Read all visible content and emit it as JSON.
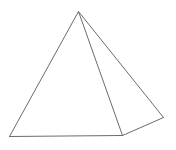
{
  "diagram": {
    "title": "",
    "shape": "square pyramid (wireframe)",
    "stroke_color": "#6b6b6b",
    "background": "#ffffff",
    "vertices": {
      "apex": [
        78,
        11
      ],
      "base_front_left": [
        9,
        136
      ],
      "base_front_right": [
        122,
        135
      ],
      "base_back_right": [
        163,
        117
      ]
    },
    "edges": [
      {
        "name": "edge-apex-front-left",
        "from": "apex",
        "to": "base_front_left"
      },
      {
        "name": "edge-apex-front-right",
        "from": "apex",
        "to": "base_front_right"
      },
      {
        "name": "edge-apex-back-right",
        "from": "apex",
        "to": "base_back_right"
      },
      {
        "name": "edge-base-front",
        "from": "base_front_left",
        "to": "base_front_right"
      },
      {
        "name": "edge-base-right",
        "from": "base_front_right",
        "to": "base_back_right"
      }
    ]
  }
}
